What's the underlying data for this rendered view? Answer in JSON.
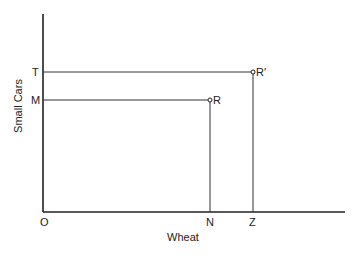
{
  "diagram": {
    "x_axis_label": "Wheat",
    "y_axis_label": "Small Cars",
    "origin_label": "O",
    "x_points": [
      {
        "id": "N",
        "label": "N"
      },
      {
        "id": "Z",
        "label": "Z"
      }
    ],
    "y_points": [
      {
        "id": "T",
        "label": "T"
      },
      {
        "id": "M",
        "label": "M"
      }
    ],
    "points": [
      {
        "id": "R",
        "label": "R",
        "x_ref": "N",
        "y_ref": "M"
      },
      {
        "id": "R_prime",
        "label": "R′",
        "x_ref": "Z",
        "y_ref": "T"
      }
    ]
  }
}
